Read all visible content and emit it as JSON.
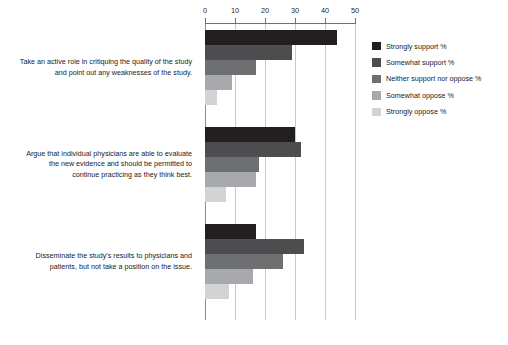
{
  "chart_data": {
    "type": "bar",
    "orientation": "horizontal",
    "title": "",
    "xlabel": "",
    "ylabel": "",
    "xlim": [
      0,
      50
    ],
    "xticks": [
      0,
      10,
      20,
      30,
      40,
      50
    ],
    "grid": true,
    "legend_position": "right",
    "categories": [
      "Take an active role in critiquing the quality of the study and point out any weaknesses of the study.",
      "Argue that individual physicians are able to evaluate the new evidence and should be permitted to continue practicing as they think best.",
      "Disseminate the study's results to physicians and patients, but not take a position on the issue."
    ],
    "series": [
      {
        "name": "Strongly support %",
        "color": "#231f20",
        "values": [
          44,
          30,
          17
        ]
      },
      {
        "name": "Somewhat support %",
        "color": "#4d4d4f",
        "values": [
          29,
          32,
          33
        ]
      },
      {
        "name": "Neither support nor oppose %",
        "color": "#6e6f71",
        "values": [
          17,
          18,
          26
        ]
      },
      {
        "name": "Somewhat oppose %",
        "color": "#a7a9ac",
        "values": [
          9,
          17,
          16
        ]
      },
      {
        "name": "Strongly oppose %",
        "color": "#d1d3d4",
        "values": [
          4,
          7,
          8
        ]
      }
    ]
  },
  "axis": {
    "tick_labels": [
      "0",
      "10",
      "20",
      "30",
      "40",
      "50"
    ]
  },
  "category_labels": [
    {
      "lines": [
        "Take an active role in critiquing the quality of the study",
        "and point out any weaknesses of the study."
      ]
    },
    {
      "lines": [
        "Argue that individual physicians are able to evaluate",
        "the new evidence and should be permitted to",
        "continue practicing as they think best."
      ]
    },
    {
      "lines": [
        "Disseminate the study's results to physicians and",
        "patients, but not take a position on the issue."
      ]
    }
  ]
}
